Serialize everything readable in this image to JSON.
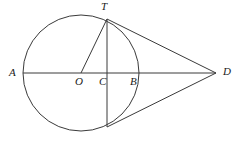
{
  "figure": {
    "kind": "circle-geometry-diagram",
    "background_color": "#ffffff",
    "stroke_color": "#3a3a3a",
    "label_color": "#1a1a1a",
    "stroke_width": 1
  },
  "circle": {
    "center_x": 81,
    "center_y": 73,
    "radius": 58
  },
  "points": [
    {
      "id": "A",
      "label": "A",
      "x": 23,
      "y": 73,
      "label_x": 9,
      "label_y": 67
    },
    {
      "id": "O",
      "label": "O",
      "x": 81,
      "y": 73,
      "label_x": 75,
      "label_y": 76
    },
    {
      "id": "C",
      "label": "C",
      "x": 107,
      "y": 73,
      "label_x": 99,
      "label_y": 76
    },
    {
      "id": "B",
      "label": "B",
      "x": 139,
      "y": 73,
      "label_x": 130,
      "label_y": 76
    },
    {
      "id": "T",
      "label": "T",
      "x": 107,
      "y": 19,
      "label_x": 101,
      "label_y": 1
    },
    {
      "id": "D",
      "label": "D",
      "x": 216,
      "y": 73,
      "label_x": 223,
      "label_y": 66
    },
    {
      "id": "Tp",
      "label": "",
      "x": 107,
      "y": 127,
      "label_x": 0,
      "label_y": 0
    }
  ],
  "segments": [
    {
      "id": "AD",
      "name": "diameter-extended-AD",
      "x1": 23,
      "y1": 73,
      "x2": 216,
      "y2": 73
    },
    {
      "id": "OT",
      "name": "radius-OT",
      "x1": 81,
      "y1": 73,
      "x2": 107,
      "y2": 19
    },
    {
      "id": "TTp",
      "name": "chord-T-Tprime",
      "x1": 107,
      "y1": 19,
      "x2": 107,
      "y2": 127
    },
    {
      "id": "TD",
      "name": "tangent-TD",
      "x1": 107,
      "y1": 19,
      "x2": 216,
      "y2": 73
    },
    {
      "id": "TpD",
      "name": "tangent-Tprime-D",
      "x1": 107,
      "y1": 127,
      "x2": 216,
      "y2": 73
    }
  ]
}
